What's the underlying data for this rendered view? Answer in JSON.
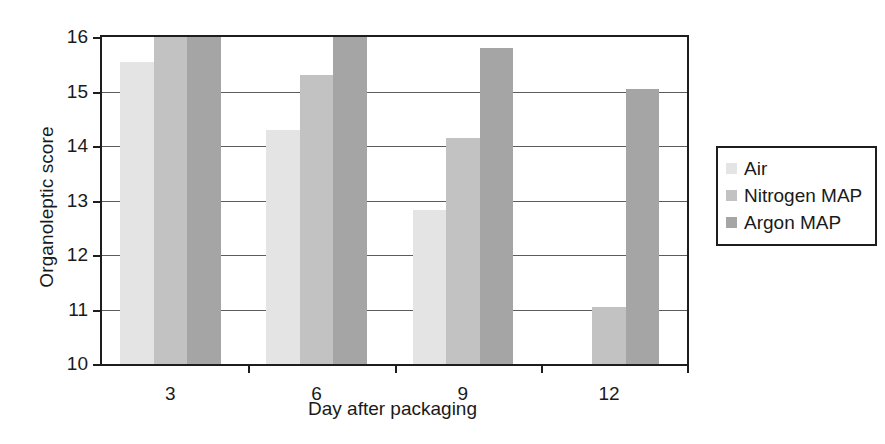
{
  "chart_data": {
    "type": "bar",
    "title": "",
    "xlabel": "Day after packaging",
    "ylabel": "Organoleptic score",
    "categories": [
      "3",
      "6",
      "9",
      "12"
    ],
    "ylim": [
      10,
      16
    ],
    "yticks": [
      "10",
      "11",
      "12",
      "13",
      "14",
      "15",
      "16"
    ],
    "grid": true,
    "legend_position": "right",
    "series": [
      {
        "name": "Air",
        "color": "#e4e4e4",
        "values": [
          15.55,
          14.3,
          12.82,
          10.0
        ]
      },
      {
        "name": "Nitrogen MAP",
        "color": "#c2c2c2",
        "values": [
          16.0,
          15.3,
          14.15,
          11.05
        ]
      },
      {
        "name": "Argon MAP",
        "color": "#a5a5a5",
        "values": [
          16.0,
          16.0,
          15.8,
          15.05
        ]
      }
    ]
  },
  "legend": {
    "items": [
      {
        "label": "Air"
      },
      {
        "label": "Nitrogen MAP"
      },
      {
        "label": "Argon MAP"
      }
    ]
  }
}
